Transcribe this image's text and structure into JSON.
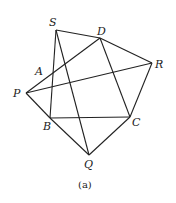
{
  "figure": {
    "caption": "(a)",
    "points": {
      "S": {
        "label": "S",
        "x": 56,
        "y": 30
      },
      "D": {
        "label": "D",
        "x": 100,
        "y": 38
      },
      "R": {
        "label": "R",
        "x": 152,
        "y": 63
      },
      "A": {
        "label": "A",
        "x": 48,
        "y": 71
      },
      "P": {
        "label": "P",
        "x": 26,
        "y": 93
      },
      "B": {
        "label": "B",
        "x": 50,
        "y": 118
      },
      "C": {
        "label": "C",
        "x": 130,
        "y": 117
      },
      "Q": {
        "label": "Q",
        "x": 89,
        "y": 155
      }
    },
    "segments": [
      [
        "S",
        "D"
      ],
      [
        "D",
        "R"
      ],
      [
        "S",
        "B"
      ],
      [
        "S",
        "Q"
      ],
      [
        "P",
        "D"
      ],
      [
        "P",
        "R"
      ],
      [
        "P",
        "B"
      ],
      [
        "B",
        "C"
      ],
      [
        "B",
        "Q"
      ],
      [
        "C",
        "Q"
      ],
      [
        "R",
        "C"
      ],
      [
        "D",
        "C"
      ]
    ]
  }
}
